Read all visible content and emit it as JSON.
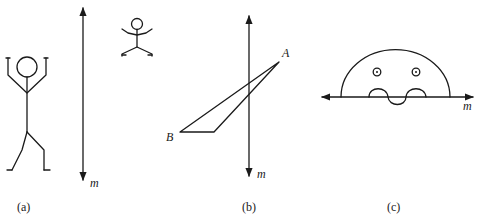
{
  "panels": [
    {
      "caption": "(a)",
      "line_label": "m"
    },
    {
      "caption": "(b)",
      "line_label": "m",
      "vertex_a": "A",
      "vertex_b": "B"
    },
    {
      "caption": "(c)",
      "line_label": "m"
    }
  ]
}
